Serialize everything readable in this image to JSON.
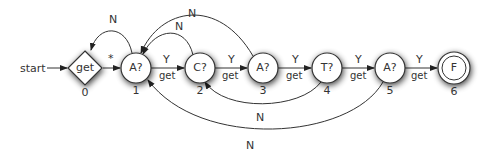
{
  "diagram": {
    "type": "state-machine",
    "start_label": "start",
    "nodes": [
      {
        "id": "0",
        "label": "get",
        "shape": "diamond",
        "index_label": "0",
        "x": 85,
        "y": 68
      },
      {
        "id": "1",
        "label": "A?",
        "shape": "circle",
        "index_label": "1",
        "x": 136,
        "y": 68
      },
      {
        "id": "2",
        "label": "C?",
        "shape": "circle",
        "index_label": "2",
        "x": 200,
        "y": 68
      },
      {
        "id": "3",
        "label": "A?",
        "shape": "circle",
        "index_label": "3",
        "x": 263,
        "y": 68
      },
      {
        "id": "4",
        "label": "T?",
        "shape": "circle",
        "index_label": "4",
        "x": 327,
        "y": 68
      },
      {
        "id": "5",
        "label": "A?",
        "shape": "circle",
        "index_label": "5",
        "x": 390,
        "y": 68
      },
      {
        "id": "6",
        "label": "F",
        "shape": "double-circle",
        "index_label": "6",
        "x": 454,
        "y": 68
      }
    ],
    "edges": [
      {
        "from": "start",
        "to": "0",
        "label": ""
      },
      {
        "from": "0",
        "to": "1",
        "label": "*"
      },
      {
        "from": "1",
        "to": "0",
        "label": "N"
      },
      {
        "from": "1",
        "to": "2",
        "label": "Y",
        "sublabel": "get"
      },
      {
        "from": "2",
        "to": "3",
        "label": "Y",
        "sublabel": "get"
      },
      {
        "from": "3",
        "to": "4",
        "label": "Y",
        "sublabel": "get"
      },
      {
        "from": "4",
        "to": "5",
        "label": "Y",
        "sublabel": "get"
      },
      {
        "from": "5",
        "to": "6",
        "label": "Y",
        "sublabel": "get"
      },
      {
        "from": "2",
        "to": "1",
        "label": "N"
      },
      {
        "from": "3",
        "to": "1",
        "label": "N"
      },
      {
        "from": "4",
        "to": "2",
        "label": "N"
      },
      {
        "from": "5",
        "to": "1",
        "label": "N"
      }
    ]
  },
  "labels": {
    "start": "start",
    "star": "*",
    "N": "N",
    "Y": "Y",
    "get": "get",
    "n0": "get",
    "n1": "A?",
    "n2": "C?",
    "n3": "A?",
    "n4": "T?",
    "n5": "A?",
    "n6": "F",
    "i0": "0",
    "i1": "1",
    "i2": "2",
    "i3": "3",
    "i4": "4",
    "i5": "5",
    "i6": "6"
  },
  "colors": {
    "stroke": "#333333",
    "fill": "#ffffff",
    "shadow": "#000000"
  }
}
